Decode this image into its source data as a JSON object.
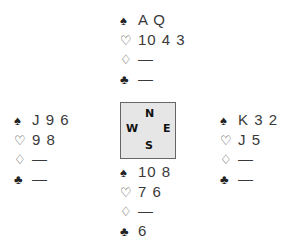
{
  "suits": {
    "spades": "♠",
    "hearts": "♡",
    "diamonds": "♢",
    "clubs": "♣"
  },
  "hands": {
    "north": {
      "spades": "A Q",
      "hearts": "10 4 3",
      "diamonds": "—",
      "clubs": "—"
    },
    "west": {
      "spades": "J 9 6",
      "hearts": "9 8",
      "diamonds": "—",
      "clubs": "—"
    },
    "east": {
      "spades": "K 3 2",
      "hearts": "J 5",
      "diamonds": "—",
      "clubs": "—"
    },
    "south": {
      "spades": "10 8",
      "hearts": "7 6",
      "diamonds": "—",
      "clubs": "6"
    }
  },
  "compass": {
    "north": "N",
    "west": "W",
    "east": "E",
    "south": "S"
  },
  "colors": {
    "compass_bg": "#e6e6e6",
    "compass_border": "#666666"
  }
}
